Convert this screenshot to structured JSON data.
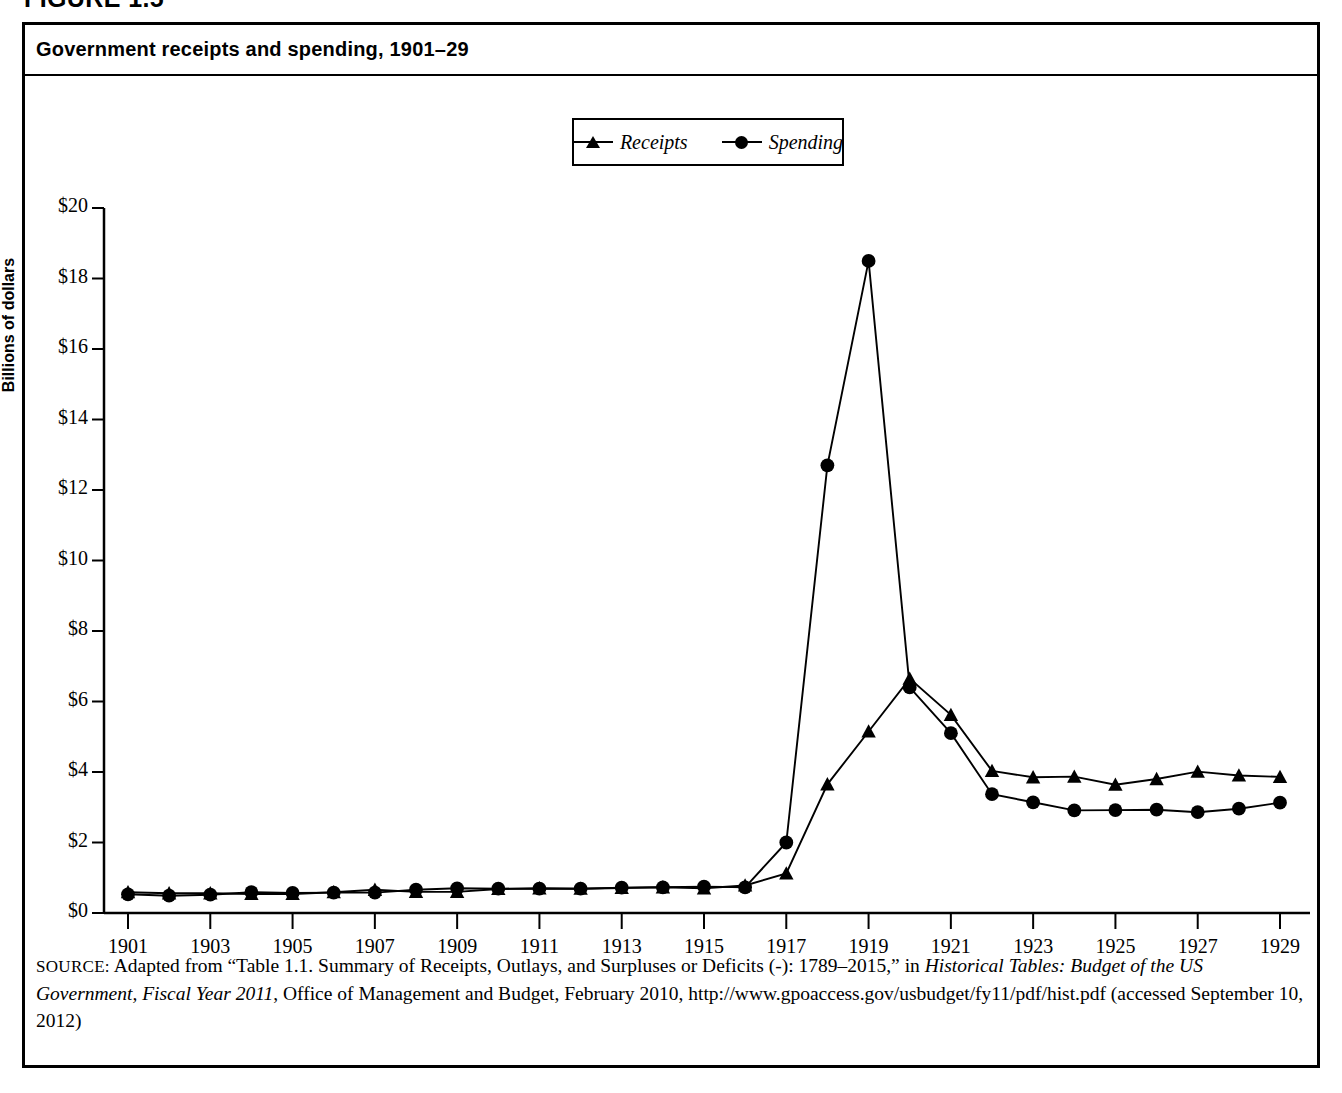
{
  "figure": {
    "label": "FIGURE 1.5"
  },
  "title": "Government receipts and spending, 1901–29",
  "legend": {
    "items": [
      {
        "label": "Receipts",
        "marker": "triangle-marker",
        "color": "#000000"
      },
      {
        "label": "Spending",
        "marker": "circle-marker",
        "color": "#000000"
      }
    ]
  },
  "source": {
    "prefix": "SOURCE:",
    "text_1": " Adapted from “Table 1.1. Summary of Receipts, Outlays, and Surpluses or Deficits (-): 1789–2015,” in ",
    "italic_1": "Historical Tables: Budget of the US Government, Fiscal Year 2011",
    "text_2": ", Office of Management and Budget, February 2010, http://www.gpoaccess.gov/usbudget/fy11/pdf/hist.pdf (accessed September 10, 2012)"
  },
  "chart_data": {
    "type": "line",
    "title": "Government receipts and spending, 1901–29",
    "xlabel": "",
    "ylabel": "Billions of dollars",
    "xlim": [
      1901,
      1929
    ],
    "ylim": [
      0,
      20
    ],
    "ytick_labels": [
      "$0",
      "$2",
      "$4",
      "$6",
      "$8",
      "$10",
      "$12",
      "$14",
      "$16",
      "$18",
      "$20"
    ],
    "ytick_values": [
      0,
      2,
      4,
      6,
      8,
      10,
      12,
      14,
      16,
      18,
      20
    ],
    "xtick_labels": [
      "1901",
      "1903",
      "1905",
      "1907",
      "1909",
      "1911",
      "1913",
      "1915",
      "1917",
      "1919",
      "1921",
      "1923",
      "1925",
      "1927",
      "1929"
    ],
    "xtick_values": [
      1901,
      1903,
      1905,
      1907,
      1909,
      1911,
      1913,
      1915,
      1917,
      1919,
      1921,
      1923,
      1925,
      1927,
      1929
    ],
    "grid": false,
    "legend_position": "top-center",
    "x": [
      1901,
      1902,
      1903,
      1904,
      1905,
      1906,
      1907,
      1908,
      1909,
      1910,
      1911,
      1912,
      1913,
      1914,
      1915,
      1916,
      1917,
      1918,
      1919,
      1920,
      1921,
      1922,
      1923,
      1924,
      1925,
      1926,
      1927,
      1928,
      1929
    ],
    "series": [
      {
        "name": "Receipts",
        "marker": "triangle",
        "values": [
          0.59,
          0.56,
          0.56,
          0.54,
          0.54,
          0.59,
          0.66,
          0.6,
          0.6,
          0.68,
          0.7,
          0.69,
          0.71,
          0.73,
          0.7,
          0.78,
          1.12,
          3.65,
          5.15,
          6.65,
          5.62,
          4.03,
          3.85,
          3.87,
          3.64,
          3.8,
          4.01,
          3.9,
          3.86
        ]
      },
      {
        "name": "Spending",
        "marker": "circle",
        "values": [
          0.53,
          0.49,
          0.52,
          0.59,
          0.57,
          0.58,
          0.58,
          0.66,
          0.7,
          0.69,
          0.69,
          0.69,
          0.72,
          0.73,
          0.75,
          0.73,
          2.0,
          12.7,
          18.5,
          6.4,
          5.1,
          3.37,
          3.14,
          2.91,
          2.92,
          2.93,
          2.86,
          2.96,
          3.13
        ]
      }
    ]
  }
}
